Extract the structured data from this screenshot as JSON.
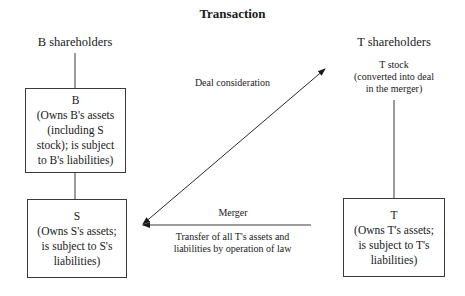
{
  "title": "Transaction",
  "nodes": {
    "b_shareholders": {
      "label": "B shareholders"
    },
    "t_shareholders": {
      "label": "T shareholders",
      "note": [
        "T stock",
        "(converted into deal",
        "in the merger)"
      ]
    },
    "b": {
      "name": "B",
      "lines": [
        "(Owns B's assets",
        "(including S",
        "stock); is subject",
        "to B's liabilities)"
      ]
    },
    "s": {
      "name": "S",
      "lines": [
        "(Owns S's assets;",
        "is subject to S's",
        "liabilities)"
      ]
    },
    "t": {
      "name": "T",
      "lines": [
        "(Owns T's assets;",
        "is subject to T's",
        "liabilities)"
      ]
    }
  },
  "edges": {
    "deal_consideration": {
      "label": "Deal consideration",
      "from": "S",
      "to": "T shareholders",
      "type": "double-arrow"
    },
    "merger": {
      "label": "Merger",
      "sublabel": [
        "Transfer of all T's assets and",
        "liabilities by operation of law"
      ],
      "from": "T",
      "to": "S",
      "type": "arrow"
    },
    "b_shareholders_to_b": {
      "type": "line"
    },
    "b_to_s": {
      "type": "line"
    },
    "t_shareholders_to_t": {
      "type": "line"
    }
  }
}
